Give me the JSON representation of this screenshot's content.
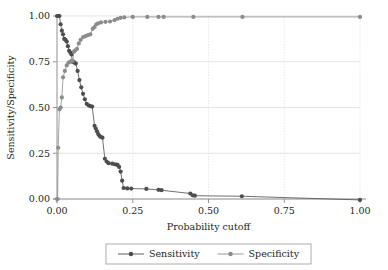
{
  "chart_data": {
    "type": "line",
    "title": "",
    "subtitle": "",
    "xlabel": "Probability cutoff",
    "ylabel": "Sensitivity/Specificity",
    "xlim": [
      0.0,
      1.0
    ],
    "ylim": [
      0.0,
      1.0
    ],
    "xticks": [
      "0.00",
      "0.25",
      "0.50",
      "0.75",
      "1.00"
    ],
    "xtick_values": [
      0.0,
      0.25,
      0.5,
      0.75,
      1.0
    ],
    "yticks": [
      "0.00",
      "0.25",
      "0.50",
      "0.75",
      "1.00"
    ],
    "ytick_values": [
      0.0,
      0.25,
      0.5,
      0.75,
      1.0
    ],
    "grid": true,
    "grid_color": "#d9d9d9",
    "legend_position": "bottom-center",
    "markers": "filled-circle",
    "series": [
      {
        "name": "Sensitivity",
        "color": "#4d4d4d",
        "points": [
          [
            0.0,
            1.0
          ],
          [
            0.004,
            1.0
          ],
          [
            0.008,
            1.0
          ],
          [
            0.012,
            0.955
          ],
          [
            0.016,
            0.92
          ],
          [
            0.02,
            0.9
          ],
          [
            0.024,
            0.875
          ],
          [
            0.028,
            0.87
          ],
          [
            0.032,
            0.86
          ],
          [
            0.036,
            0.835
          ],
          [
            0.04,
            0.81
          ],
          [
            0.044,
            0.8
          ],
          [
            0.048,
            0.79
          ],
          [
            0.05,
            0.755
          ],
          [
            0.052,
            0.75
          ],
          [
            0.055,
            0.748
          ],
          [
            0.058,
            0.745
          ],
          [
            0.062,
            0.74
          ],
          [
            0.068,
            0.7
          ],
          [
            0.074,
            0.65
          ],
          [
            0.08,
            0.61
          ],
          [
            0.086,
            0.575
          ],
          [
            0.092,
            0.545
          ],
          [
            0.098,
            0.52
          ],
          [
            0.104,
            0.512
          ],
          [
            0.11,
            0.508
          ],
          [
            0.116,
            0.505
          ],
          [
            0.124,
            0.4
          ],
          [
            0.128,
            0.385
          ],
          [
            0.132,
            0.37
          ],
          [
            0.136,
            0.355
          ],
          [
            0.14,
            0.345
          ],
          [
            0.144,
            0.34
          ],
          [
            0.15,
            0.335
          ],
          [
            0.158,
            0.22
          ],
          [
            0.164,
            0.205
          ],
          [
            0.17,
            0.196
          ],
          [
            0.182,
            0.193
          ],
          [
            0.19,
            0.19
          ],
          [
            0.196,
            0.188
          ],
          [
            0.2,
            0.186
          ],
          [
            0.205,
            0.175
          ],
          [
            0.21,
            0.15
          ],
          [
            0.215,
            0.1
          ],
          [
            0.22,
            0.06
          ],
          [
            0.232,
            0.058
          ],
          [
            0.245,
            0.057
          ],
          [
            0.295,
            0.055
          ],
          [
            0.335,
            0.05
          ],
          [
            0.345,
            0.048
          ],
          [
            0.44,
            0.03
          ],
          [
            0.448,
            0.02
          ],
          [
            0.455,
            0.018
          ],
          [
            0.61,
            0.015
          ],
          [
            1.0,
            -0.005
          ]
        ]
      },
      {
        "name": "Specificity",
        "color": "#8c8c8c",
        "points": [
          [
            0.0,
            0.0
          ],
          [
            0.002,
            0.0
          ],
          [
            0.004,
            0.28
          ],
          [
            0.008,
            0.49
          ],
          [
            0.012,
            0.5
          ],
          [
            0.016,
            0.555
          ],
          [
            0.02,
            0.665
          ],
          [
            0.026,
            0.7
          ],
          [
            0.032,
            0.73
          ],
          [
            0.038,
            0.745
          ],
          [
            0.044,
            0.75
          ],
          [
            0.048,
            0.752
          ],
          [
            0.052,
            0.755
          ],
          [
            0.056,
            0.805
          ],
          [
            0.06,
            0.812
          ],
          [
            0.066,
            0.82
          ],
          [
            0.072,
            0.85
          ],
          [
            0.078,
            0.87
          ],
          [
            0.086,
            0.885
          ],
          [
            0.094,
            0.89
          ],
          [
            0.102,
            0.895
          ],
          [
            0.11,
            0.9
          ],
          [
            0.118,
            0.93
          ],
          [
            0.124,
            0.94
          ],
          [
            0.13,
            0.955
          ],
          [
            0.136,
            0.96
          ],
          [
            0.145,
            0.965
          ],
          [
            0.16,
            0.968
          ],
          [
            0.175,
            0.97
          ],
          [
            0.19,
            0.978
          ],
          [
            0.2,
            0.985
          ],
          [
            0.21,
            0.99
          ],
          [
            0.222,
            0.993
          ],
          [
            0.25,
            0.995
          ],
          [
            0.298,
            0.995
          ],
          [
            0.335,
            0.995
          ],
          [
            0.352,
            0.995
          ],
          [
            0.45,
            0.995
          ],
          [
            0.612,
            0.995
          ],
          [
            1.0,
            0.995
          ]
        ]
      }
    ]
  },
  "legend": {
    "items": [
      {
        "label": "Sensitivity",
        "color": "#4d4d4d"
      },
      {
        "label": "Specificity",
        "color": "#8c8c8c"
      }
    ]
  },
  "geometry": {
    "plot_left": 57,
    "plot_right": 360,
    "plot_top": 16,
    "plot_bottom": 199
  }
}
